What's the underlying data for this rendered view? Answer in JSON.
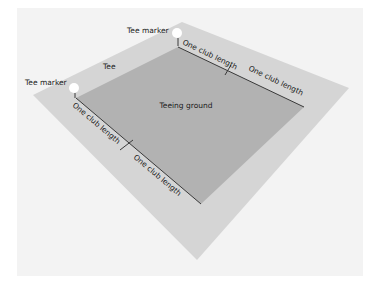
{
  "colors": {
    "page_background": "#ffffff",
    "panel_background": "#f3f3f3",
    "tee_area": "#d5d5d5",
    "teeing_ground": "#b2b2b2",
    "marker": "#ffffff",
    "measure_line": "#3a3a3a",
    "label_text": "#1a1a1a"
  },
  "labels": {
    "tee_marker_top": "Tee marker",
    "tee_marker_left": "Tee marker",
    "tee": "Tee",
    "teeing_ground": "Teeing ground",
    "top_segment_1": "One club length",
    "top_segment_2": "One club length",
    "left_segment_1": "One club length",
    "left_segment_2": "One club length"
  }
}
